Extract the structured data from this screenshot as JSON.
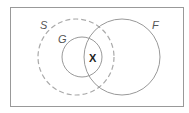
{
  "diagram": {
    "type": "venn",
    "sets": [
      {
        "label": "S",
        "style": "dashed"
      },
      {
        "label": "G",
        "style": "solid"
      },
      {
        "label": "F",
        "style": "solid"
      }
    ],
    "region_label": "X",
    "colors": {
      "stroke": "#999999",
      "dashed_stroke": "#aaaaaa",
      "frame": "#999999",
      "background": "#ffffff"
    }
  }
}
